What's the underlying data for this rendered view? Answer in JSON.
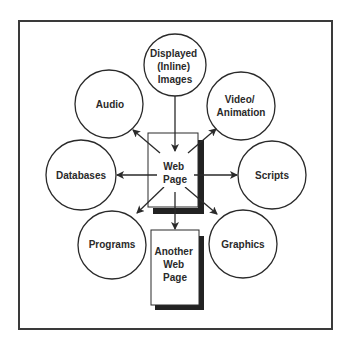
{
  "diagram": {
    "center": {
      "lines": [
        "Web",
        "Page"
      ]
    },
    "nodes": [
      {
        "id": "displayed-images",
        "lines": [
          "Displayed",
          "(Inline)",
          "Images"
        ]
      },
      {
        "id": "audio",
        "lines": [
          "Audio"
        ]
      },
      {
        "id": "video-animation",
        "lines": [
          "Video/",
          "Animation"
        ]
      },
      {
        "id": "databases",
        "lines": [
          "Databases"
        ]
      },
      {
        "id": "scripts",
        "lines": [
          "Scripts"
        ]
      },
      {
        "id": "programs",
        "lines": [
          "Programs"
        ]
      },
      {
        "id": "graphics",
        "lines": [
          "Graphics"
        ]
      }
    ],
    "another_page": {
      "lines": [
        "Another",
        "Web",
        "Page"
      ]
    },
    "edges": [
      {
        "from": "displayed-images",
        "to": "web-page"
      },
      {
        "from": "web-page",
        "to": "audio"
      },
      {
        "from": "web-page",
        "to": "video-animation"
      },
      {
        "from": "web-page",
        "to": "databases"
      },
      {
        "from": "web-page",
        "to": "scripts"
      },
      {
        "from": "web-page",
        "to": "programs"
      },
      {
        "from": "web-page",
        "to": "graphics"
      },
      {
        "from": "web-page",
        "to": "another-web-page"
      }
    ],
    "colors": {
      "stroke": "#2a2a2a",
      "shadow": "#222222",
      "background": "#ffffff"
    }
  }
}
